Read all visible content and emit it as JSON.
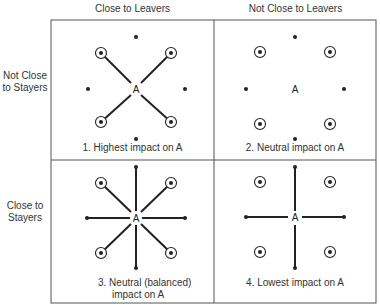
{
  "columns": {
    "left": "Close to Leavers",
    "right": "Not Close to Leavers"
  },
  "rows": {
    "top": [
      "Not Close",
      "to Stayers"
    ],
    "bottom": [
      "Close to",
      "Stayers"
    ]
  },
  "center_label": "A",
  "panels": [
    {
      "id": 1,
      "caption": "1.  Highest impact on A",
      "links_to_leavers": true,
      "links_to_stayers": false
    },
    {
      "id": 2,
      "caption": "2.  Neutral impact on A",
      "links_to_leavers": false,
      "links_to_stayers": false
    },
    {
      "id": 3,
      "caption_lines": [
        "3.  Neutral (balanced)",
        "impact on A"
      ],
      "links_to_leavers": true,
      "links_to_stayers": true
    },
    {
      "id": 4,
      "caption": "4.  Lowest impact on A",
      "links_to_leavers": false,
      "links_to_stayers": true
    }
  ],
  "legend_semantics": {
    "circled_dot": "leaver",
    "plain_dot": "stayer"
  },
  "colors": {
    "ink": "#222222",
    "border": "#555555"
  }
}
